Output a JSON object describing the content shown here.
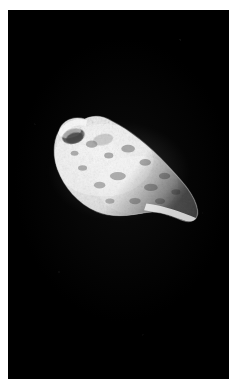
{
  "document": {
    "type": "photograph",
    "media": "grayscale astronomical image print",
    "has_text_annotations": false,
    "width_px": 233,
    "height_px": 382
  },
  "page": {
    "background_color": "#ffffff",
    "margin": {
      "left_px": 8,
      "top_px": 10,
      "right_px": 4,
      "bottom_px": 3
    }
  },
  "photo": {
    "name": "astronomical-photograph",
    "background_color": "#000000",
    "plate": {
      "left_px": 8,
      "top_px": 10,
      "width_px": 221,
      "height_px": 369
    },
    "subject": {
      "label": "irregular cratered body",
      "description": "elongated lemon-shaped small solar-system body, brightly lit, heavily cratered surface, tapering to a bright point at lower right and a blunt notched end at upper left",
      "body_color_bright": "#f3f3f3",
      "body_color_mid": "#b9b9b9",
      "body_color_shadow": "#4a4a4a",
      "limb_highlight_color": "#ffffff",
      "bounds": {
        "left_px": 53,
        "top_px": 121,
        "width_px": 132,
        "height_px": 101
      },
      "orientation": "long axis tilted, upper-left to lower-right",
      "features": [
        {
          "name": "dark-crater-upper-left",
          "kind": "crater",
          "center_px": [
            70,
            133
          ],
          "radius_px": 9,
          "tone": "dark"
        },
        {
          "name": "bright-rim-upper-left",
          "kind": "ridge",
          "center_px": [
            76,
            127
          ],
          "tone": "bright"
        },
        {
          "name": "bright-tip-lower-right",
          "kind": "limb-point",
          "center_px": [
            176,
            208
          ],
          "tone": "bright"
        },
        {
          "name": "smooth-limb-lower-left",
          "kind": "limb",
          "center_px": [
            78,
            196
          ],
          "tone": "mid"
        },
        {
          "name": "terminator-upper-right",
          "kind": "terminator",
          "center_px": [
            150,
            140
          ],
          "tone": "dark"
        }
      ],
      "texture": "dense speckled regolith, high-contrast craterlets"
    }
  },
  "colors": {
    "field": "#000000",
    "paper": "#ffffff",
    "highlight": "#ffffff",
    "midtone": "#b9b9b9",
    "shadow": "#3a3a3a"
  }
}
